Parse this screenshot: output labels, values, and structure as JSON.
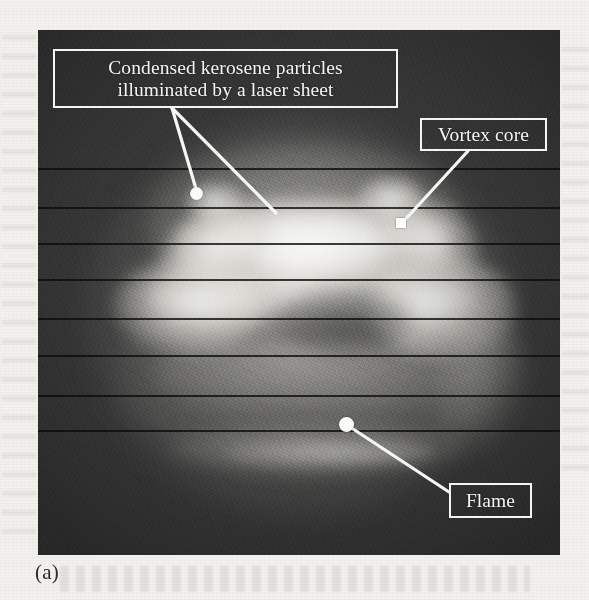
{
  "figure": {
    "subfigure_label": "(a)",
    "panel_background_color": "#3c3c3c",
    "page_background_color": "#f3f1ee",
    "annotation_color": "#f6f6f4"
  },
  "annotations": [
    {
      "id": "particles",
      "line1": "Condensed kerosene particles",
      "line2": "illuminated by a laser sheet",
      "marker": "dot"
    },
    {
      "id": "vortex_core",
      "label": "Vortex core",
      "marker": "square"
    },
    {
      "id": "flame",
      "label": "Flame",
      "marker": "dot"
    }
  ],
  "image_content": {
    "description": "Laser-sheet flow-visualization photograph of a burning vortex ring",
    "features": [
      "bright mushroom-shaped vortex ring core",
      "left vortex lobe",
      "right vortex lobe",
      "faint outer spherical envelope",
      "faint horizontal flame arc near the bottom",
      "horizontal video raster scan lines"
    ],
    "scan_line_count": 8
  }
}
